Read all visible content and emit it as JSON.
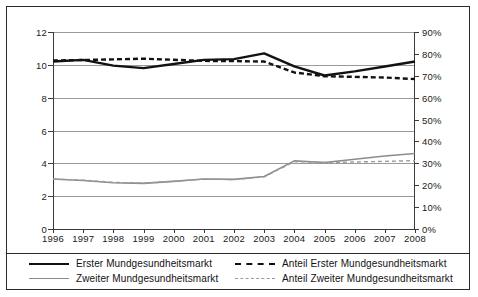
{
  "chart_data": {
    "type": "line",
    "title": "",
    "xlabel": "",
    "ylabel": "",
    "grid": true,
    "legend_position": "bottom",
    "categories": [
      "1996",
      "1997",
      "1998",
      "1999",
      "2000",
      "2001",
      "2002",
      "2003",
      "2004",
      "2005",
      "2006",
      "2007",
      "2008"
    ],
    "axes": {
      "left": {
        "label": "",
        "ylim": [
          0,
          12
        ],
        "ticks": [
          "0",
          "2",
          "4",
          "6",
          "8",
          "10",
          "12"
        ],
        "tick_values": [
          0,
          2,
          4,
          6,
          8,
          10,
          12
        ]
      },
      "right": {
        "label": "",
        "ylim": [
          0,
          90
        ],
        "ticks": [
          "0%",
          "10%",
          "20%",
          "30%",
          "40%",
          "50%",
          "60%",
          "70%",
          "80%",
          "90%"
        ],
        "tick_values": [
          0,
          10,
          20,
          30,
          40,
          50,
          60,
          70,
          80,
          90
        ]
      }
    },
    "series": [
      {
        "name": "Erster Mundgesundheitsmarkt",
        "axis": "left",
        "style": "solid",
        "color": "#121212",
        "width": 2.4,
        "values": [
          10.2,
          10.3,
          9.95,
          9.8,
          10.05,
          10.3,
          10.35,
          10.7,
          9.9,
          9.35,
          9.6,
          9.9,
          10.2
        ]
      },
      {
        "name": "Zweiter Mundgesundheitsmarkt",
        "axis": "left",
        "style": "solid",
        "color": "#8c8c8c",
        "width": 1.6,
        "values": [
          3.05,
          2.95,
          2.82,
          2.78,
          2.9,
          3.05,
          3.02,
          3.2,
          4.15,
          4.05,
          4.25,
          4.45,
          4.6
        ]
      },
      {
        "name": "Anteil Erster Mundgesundheitsmarkt",
        "axis": "right",
        "style": "dashed",
        "color": "#121212",
        "width": 2.4,
        "values": [
          77.0,
          77.2,
          77.5,
          77.8,
          77.3,
          76.8,
          76.7,
          76.5,
          71.5,
          69.8,
          69.5,
          69.2,
          68.5
        ]
      },
      {
        "name": "Anteil Zweiter Mundgesundheitsmarkt",
        "axis": "right",
        "style": "dashed",
        "color": "#9a9a9a",
        "width": 1.4,
        "values": [
          22.8,
          22.3,
          21.3,
          21.0,
          21.8,
          22.8,
          22.6,
          23.8,
          30.8,
          30.4,
          30.6,
          30.9,
          31.2
        ]
      }
    ]
  },
  "legend": {
    "entries": [
      {
        "label": "Erster Mundgesundheitsmarkt",
        "swatch": "solid-black"
      },
      {
        "label": "Zweiter Mundgesundheitsmarkt",
        "swatch": "solid-gray"
      },
      {
        "label": "Anteil Erster Mundgesundheitsmarkt",
        "swatch": "dash-black"
      },
      {
        "label": "Anteil Zweiter Mundgesundheitsmarkt",
        "swatch": "dash-gray"
      }
    ]
  },
  "colors": {
    "primary": "#121212",
    "secondary": "#8c8c8c",
    "grid": "#9a9a9a",
    "border": "#2b2b2b",
    "background": "#ffffff"
  }
}
